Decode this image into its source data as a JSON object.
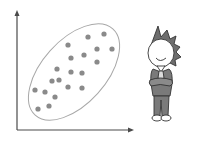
{
  "figure": {
    "colors": {
      "axis": "#4a4a4a",
      "point": "#8a8a8a",
      "ellipse": "#a8a8a8",
      "hair": "#6e6e6e",
      "suit": "#7a7a7a",
      "outline": "#333333"
    }
  },
  "chart_data": {
    "type": "scatter",
    "title": "",
    "xlabel": "",
    "ylabel": "",
    "grid": false,
    "legend": null,
    "annotation": "ellipse enclosing all points (positive correlation)",
    "points": [
      {
        "x": 88,
        "y": 37
      },
      {
        "x": 104,
        "y": 34
      },
      {
        "x": 68,
        "y": 45
      },
      {
        "x": 97,
        "y": 49
      },
      {
        "x": 112,
        "y": 49
      },
      {
        "x": 71,
        "y": 58
      },
      {
        "x": 84,
        "y": 55
      },
      {
        "x": 97,
        "y": 62
      },
      {
        "x": 57,
        "y": 69
      },
      {
        "x": 71,
        "y": 72
      },
      {
        "x": 82,
        "y": 73
      },
      {
        "x": 52,
        "y": 81
      },
      {
        "x": 59,
        "y": 80
      },
      {
        "x": 68,
        "y": 87
      },
      {
        "x": 82,
        "y": 88
      },
      {
        "x": 35,
        "y": 90
      },
      {
        "x": 45,
        "y": 92
      },
      {
        "x": 55,
        "y": 97
      },
      {
        "x": 49,
        "y": 106
      },
      {
        "x": 38,
        "y": 109
      }
    ]
  },
  "character": {
    "pose": "arms crossed, smiling",
    "icon": "cartoon-person"
  }
}
